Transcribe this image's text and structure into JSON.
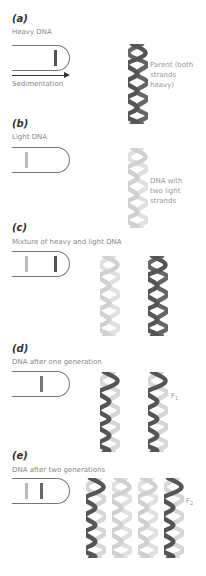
{
  "colors": {
    "heavy": "#555555",
    "light": "#cccccc",
    "hybrid_band": "#777777",
    "text": "#888888",
    "label": "#333333"
  },
  "panels": [
    {
      "id": "a",
      "label": "(a)",
      "caption": "Heavy DNA",
      "tube": {
        "bands": [
          {
            "x": 55,
            "type": "heavy"
          }
        ]
      },
      "axis_label": "Sedimentation",
      "helices": [
        {
          "strands": [
            "heavy",
            "heavy"
          ]
        }
      ],
      "note": [
        "Parent (both",
        "strands",
        "heavy)"
      ]
    },
    {
      "id": "b",
      "label": "(b)",
      "caption": "Light DNA",
      "tube": {
        "bands": [
          {
            "x": 26,
            "type": "light"
          }
        ]
      },
      "helices": [
        {
          "strands": [
            "light",
            "light"
          ]
        }
      ],
      "note": [
        "DNA with",
        "two light",
        "strands"
      ]
    },
    {
      "id": "c",
      "label": "(c)",
      "caption": "Mixture of heavy and light DNA",
      "tube": {
        "bands": [
          {
            "x": 26,
            "type": "light"
          },
          {
            "x": 55,
            "type": "heavy"
          }
        ]
      },
      "helices": [
        {
          "strands": [
            "light",
            "light"
          ]
        },
        {
          "strands": [
            "heavy",
            "heavy"
          ]
        }
      ]
    },
    {
      "id": "d",
      "label": "(d)",
      "caption": "DNA after one generation",
      "tube": {
        "bands": [
          {
            "x": 41,
            "type": "hybrid"
          }
        ]
      },
      "helices": [
        {
          "strands": [
            "light",
            "heavy"
          ]
        },
        {
          "strands": [
            "light",
            "heavy"
          ]
        }
      ],
      "generation_label": "F",
      "generation_sub": "1"
    },
    {
      "id": "e",
      "label": "(e)",
      "caption": "DNA after two generations",
      "tube": {
        "bands": [
          {
            "x": 26,
            "type": "light"
          },
          {
            "x": 41,
            "type": "hybrid"
          }
        ]
      },
      "helices": [
        {
          "strands": [
            "light",
            "heavy"
          ]
        },
        {
          "strands": [
            "light",
            "light"
          ]
        },
        {
          "strands": [
            "light",
            "light"
          ]
        },
        {
          "strands": [
            "light",
            "heavy"
          ]
        }
      ],
      "generation_label": "F",
      "generation_sub": "2"
    }
  ]
}
